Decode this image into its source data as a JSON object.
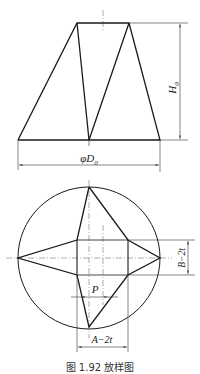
{
  "figure": {
    "caption": "图 1.92   放样图",
    "front_view": {
      "labels": {
        "height": "H",
        "height_sub": "0",
        "diameter": "φD",
        "diameter_sub": "0"
      }
    },
    "top_view": {
      "labels": {
        "width": "B−2t",
        "length": "A−2t",
        "pitch": "P"
      }
    }
  }
}
